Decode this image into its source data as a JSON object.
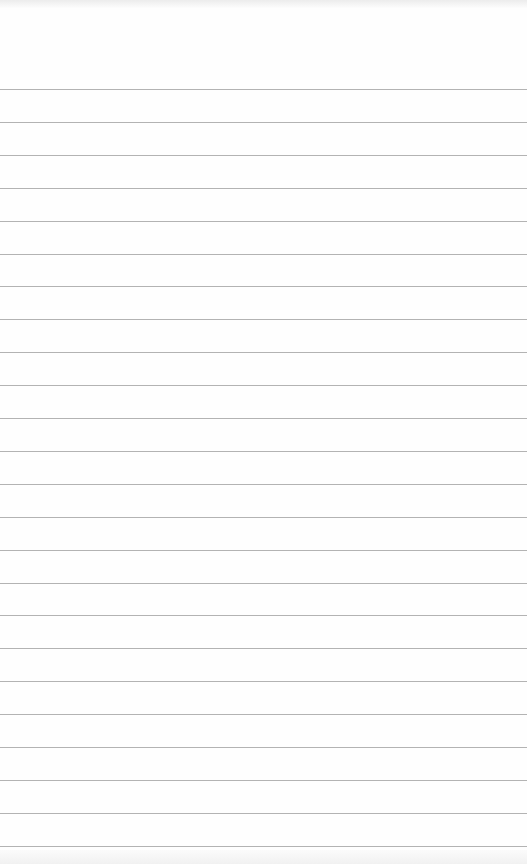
{
  "notepad": {
    "line_count": 24,
    "first_line_y": 89,
    "line_spacing": 32.9,
    "line_color": "#9a9a9a",
    "paper_color": "#fefefe",
    "lines": []
  }
}
